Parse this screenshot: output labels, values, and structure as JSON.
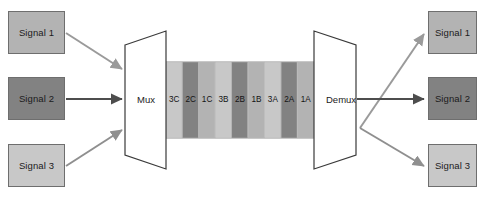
{
  "diagram": {
    "background_color": "#ffffff"
  },
  "inputs": {
    "label_group": "Input signals",
    "boxes": [
      {
        "label": "Signal 1",
        "color": "#b3b3b3",
        "x": 8,
        "y": 11,
        "w": 57,
        "h": 43
      },
      {
        "label": "Signal 2",
        "color": "#828282",
        "x": 8,
        "y": 77,
        "w": 57,
        "h": 43
      },
      {
        "label": "Signal 3",
        "color": "#c8c8c8",
        "x": 8,
        "y": 144,
        "w": 57,
        "h": 43
      }
    ]
  },
  "outputs": {
    "label_group": "Output signals",
    "boxes": [
      {
        "label": "Signal 1",
        "color": "#b3b3b3",
        "x": 428,
        "y": 11,
        "w": 49,
        "h": 43
      },
      {
        "label": "Signal 2",
        "color": "#828282",
        "x": 428,
        "y": 77,
        "w": 49,
        "h": 43
      },
      {
        "label": "Signal 3",
        "color": "#c8c8c8",
        "x": 428,
        "y": 144,
        "w": 49,
        "h": 43
      }
    ]
  },
  "devices": {
    "mux": {
      "label": "Mux",
      "cx": 146,
      "cy": 100
    },
    "demux": {
      "label": "Demux",
      "cx": 341,
      "cy": 100
    }
  },
  "link": {
    "name": "multiplexed-frame",
    "strip_x": 166,
    "strip_y": 62,
    "strip_w": 148,
    "strip_h": 76,
    "slots": [
      {
        "label": "3C",
        "color": "#c8c8c8"
      },
      {
        "label": "2C",
        "color": "#828282"
      },
      {
        "label": "1C",
        "color": "#b3b3b3"
      },
      {
        "label": "3B",
        "color": "#c8c8c8"
      },
      {
        "label": "2B",
        "color": "#828282"
      },
      {
        "label": "1B",
        "color": "#b3b3b3"
      },
      {
        "label": "3A",
        "color": "#c8c8c8"
      },
      {
        "label": "2A",
        "color": "#828282"
      },
      {
        "label": "1A",
        "color": "#b3b3b3"
      }
    ]
  },
  "arrows": {
    "input_1": {
      "color": "#9a9a9a",
      "from": [
        66,
        33
      ],
      "to": [
        124,
        70
      ]
    },
    "input_2": {
      "color": "#4d4d4d",
      "from": [
        66,
        99
      ],
      "to": [
        124,
        99
      ]
    },
    "input_3": {
      "color": "#8f8f8f",
      "from": [
        66,
        166
      ],
      "to": [
        124,
        129
      ]
    },
    "output_1": {
      "color": "#9a9a9a",
      "from": [
        362,
        129
      ],
      "to": [
        426,
        33
      ]
    },
    "output_2": {
      "color": "#4d4d4d",
      "from": [
        362,
        99
      ],
      "to": [
        426,
        99
      ]
    },
    "output_3": {
      "color": "#8f8f8f",
      "from": [
        362,
        129
      ],
      "to": [
        426,
        166
      ]
    }
  },
  "shapes": {
    "mux_outline_color": "#3a3a3a",
    "mux_fill": "#ffffff",
    "demux_outline_color": "#3a3a3a",
    "demux_fill": "#ffffff",
    "strip_border_color": "#9d9d9d"
  }
}
